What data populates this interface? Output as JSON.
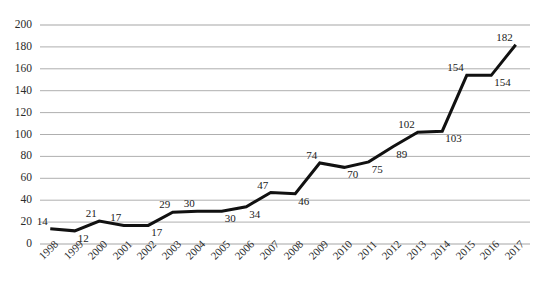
{
  "chart_data": {
    "type": "line",
    "title": "",
    "subtitle": "",
    "xlabel": "",
    "ylabel": "",
    "categories": [
      "1998",
      "1999",
      "2000",
      "2001",
      "2002",
      "2003",
      "2004",
      "2005",
      "2006",
      "2007",
      "2008",
      "2009",
      "2010",
      "2011",
      "2012",
      "2013",
      "2014",
      "2015",
      "2016",
      "2017"
    ],
    "values": [
      14,
      12,
      21,
      17,
      17,
      29,
      30,
      30,
      34,
      47,
      46,
      74,
      70,
      75,
      89,
      102,
      103,
      154,
      154,
      182
    ],
    "series": [
      {
        "name": "",
        "values": [
          14,
          12,
          21,
          17,
          17,
          29,
          30,
          30,
          34,
          47,
          46,
          74,
          70,
          75,
          89,
          102,
          103,
          154,
          154,
          182
        ]
      }
    ],
    "data_labels": [
      "14",
      "12",
      "21",
      "17",
      "17",
      "29",
      "30",
      "30",
      "34",
      "47",
      "46",
      "74",
      "70",
      "75",
      "89",
      "102",
      "103",
      "154",
      "154",
      "182"
    ],
    "label_positions": [
      "above",
      "below",
      "above",
      "above",
      "below",
      "above",
      "above",
      "below",
      "below",
      "above",
      "below",
      "above",
      "below",
      "below",
      "below",
      "above",
      "below",
      "above",
      "below",
      "above"
    ],
    "ylim": [
      0,
      200
    ],
    "ytick_values": [
      0,
      20,
      40,
      60,
      80,
      100,
      120,
      140,
      160,
      180,
      200
    ],
    "ytick_labels": [
      "0",
      "20",
      "40",
      "60",
      "80",
      "100",
      "120",
      "140",
      "160",
      "180",
      "200"
    ],
    "grid": true,
    "grid_axis": "y",
    "legend": false,
    "legend_position": "none",
    "line_color": "#111111",
    "line_width": 3,
    "grid_color": "#a6a6a6",
    "markers": false,
    "xtick_rotation": -45,
    "annotations": []
  }
}
